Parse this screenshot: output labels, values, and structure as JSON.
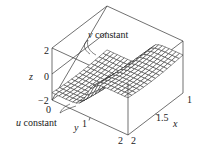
{
  "chart_data": {
    "type": "surface3d",
    "title": "",
    "xlabel": "x",
    "ylabel": "y",
    "zlabel": "z",
    "x_ticks": [
      "1",
      "1.5",
      "2"
    ],
    "y_ticks": [
      "0",
      "1",
      "2"
    ],
    "z_ticks": [
      "2",
      "0",
      "−2"
    ],
    "xlim": [
      1,
      2
    ],
    "ylim": [
      0,
      2
    ],
    "zlim": [
      -2,
      2
    ],
    "annotations": [
      {
        "text": "v constant",
        "italic_part": "v",
        "target": "mesh lines of constant v"
      },
      {
        "text": "u constant",
        "italic_part": "u",
        "target": "mesh lines of constant u"
      }
    ],
    "surface": {
      "description": "Parametric surface with a sharp step (tanh-like) in z across y≈1, z from about −1.5 to 1, mesh of u and v constant lines",
      "grid_u": 14,
      "grid_v": 22,
      "z_low": -1.4,
      "z_high": 0.9,
      "step_center_y": 1.0,
      "step_sharpness": 6
    },
    "grid": false,
    "box": true
  },
  "labels": {
    "v_constant": {
      "var": "v",
      "text": " constant"
    },
    "u_constant": {
      "var": "u",
      "text": " constant"
    },
    "z_axis": "z",
    "x_axis": "x",
    "y_axis": "y",
    "z_tick_2": "2",
    "z_tick_0": "0",
    "z_tick_m2": "−2",
    "y_tick_0": "0",
    "y_tick_1": "1",
    "y_tick_2": "2",
    "x_tick_2": "2",
    "x_tick_15": "1.5",
    "x_tick_1": "1"
  }
}
